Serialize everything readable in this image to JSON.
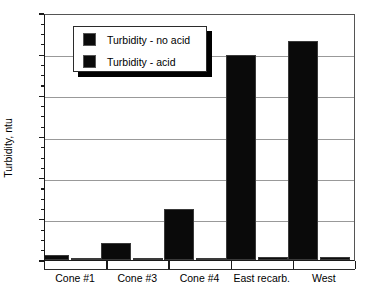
{
  "chart_data": {
    "type": "bar",
    "title": "",
    "xlabel": "",
    "ylabel": "Turbidity, ntu",
    "categories": [
      "Cone #1",
      "Cone #3",
      "Cone #4",
      "East recarb.",
      "West"
    ],
    "series": [
      {
        "name": "Turbidity - no acid",
        "values": [
          0.25,
          0.85,
          2.5,
          9.95,
          10.65
        ]
      },
      {
        "name": "Turbidity - acid",
        "values": [
          0.12,
          0.1,
          0.12,
          0.15,
          0.15
        ]
      }
    ],
    "ylim": [
      0,
      12
    ],
    "ytick_values": [
      0,
      2,
      4,
      6,
      8,
      10,
      12
    ],
    "ytick_labels": [
      "0",
      "2",
      "4",
      "6",
      "8",
      "10",
      "12"
    ],
    "yminor_step": 0.5,
    "grid": "horizontal",
    "legend_position": "upper-center-left",
    "colors": {
      "series_no_acid": "#0a0a0a",
      "series_acid": "#0d0d0d",
      "gridline": "#999999",
      "axis": "#1a1a1a",
      "background": "#ffffff"
    }
  },
  "legend": {
    "entries": [
      {
        "label": "Turbidity - no acid"
      },
      {
        "label": "Turbidity - acid"
      }
    ]
  }
}
